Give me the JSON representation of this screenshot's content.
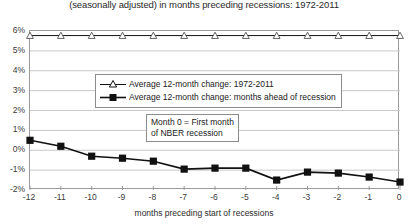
{
  "chart_data": {
    "type": "line",
    "title": "(seasonally adjusted) in months preceding recessions: 1972-2011",
    "xlabel": "months preceding start of recessions",
    "ylabel": "",
    "categories": [
      "-12",
      "-11",
      "-10",
      "-9",
      "-8",
      "-7",
      "-6",
      "-5",
      "-4",
      "-3",
      "-2",
      "-1",
      "0"
    ],
    "x": [
      -12,
      -11,
      -10,
      -9,
      -8,
      -7,
      -6,
      -5,
      -4,
      -3,
      -2,
      -1,
      0
    ],
    "xlim": [
      -12,
      0
    ],
    "ylim": [
      -2,
      6
    ],
    "yticks": [
      "-2%",
      "-1%",
      "0%",
      "1%",
      "2%",
      "3%",
      "4%",
      "5%",
      "6%"
    ],
    "ytick_values": [
      -2,
      -1,
      0,
      1,
      2,
      3,
      4,
      5,
      6
    ],
    "grid": true,
    "legend_position": "upper-center",
    "series": [
      {
        "name": "Average 12-month change: 1972-2011",
        "marker": "open-triangle",
        "values": [
          5.77,
          5.77,
          5.77,
          5.77,
          5.77,
          5.77,
          5.77,
          5.77,
          5.77,
          5.77,
          5.77,
          5.77,
          5.77
        ]
      },
      {
        "name": "Average 12-month change: months ahead of recession",
        "marker": "filled-square",
        "values": [
          0.5,
          0.2,
          -0.3,
          -0.4,
          -0.55,
          -0.95,
          -0.9,
          -0.9,
          -1.5,
          -1.1,
          -1.15,
          -1.35,
          -1.6
        ]
      }
    ],
    "annotations": [
      {
        "name": "month-zero-note",
        "line1": "Month 0 = First month",
        "line2": "of NBER recession"
      }
    ],
    "colors": {
      "series_line": "#111111",
      "grid": "#c8c8c8",
      "axis": "#9a9a9a",
      "background": "#ffffff"
    }
  }
}
